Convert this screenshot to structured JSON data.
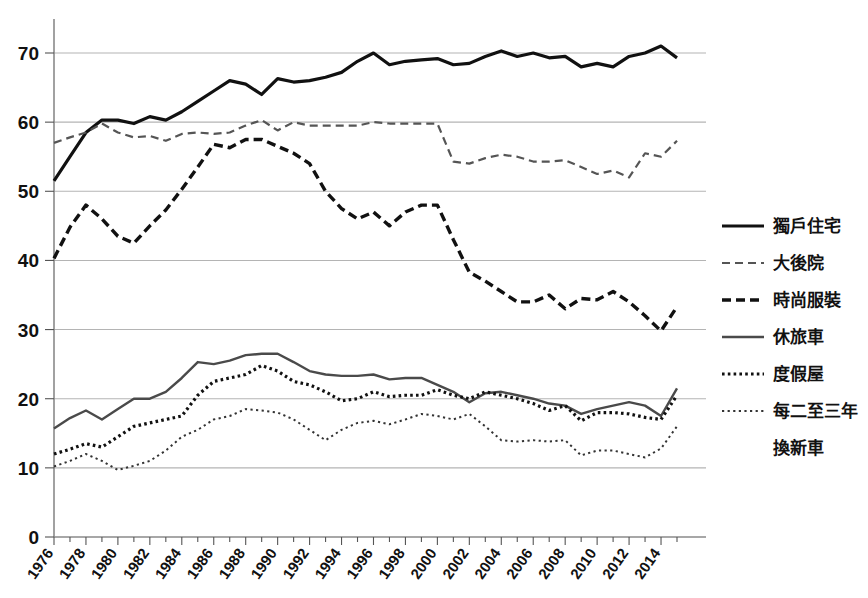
{
  "chart_data": {
    "type": "line",
    "title": "",
    "xlabel": "",
    "ylabel": "",
    "ylim": [
      0,
      75
    ],
    "yticks": [
      0,
      10,
      20,
      30,
      40,
      50,
      60,
      70
    ],
    "xlim": [
      1976,
      2015
    ],
    "xticks": [
      1976,
      1978,
      1980,
      1982,
      1984,
      1986,
      1988,
      1990,
      1992,
      1994,
      1996,
      1998,
      2000,
      2002,
      2004,
      2006,
      2008,
      2010,
      2012,
      2014
    ],
    "xtick_labels": [
      "1976",
      "1978",
      "1980",
      "1982",
      "1984",
      "1986",
      "1988",
      "1990",
      "1992",
      "1994",
      "1996",
      "1998",
      "2000",
      "2002",
      "2004",
      "2006",
      "2008",
      "2010",
      "2012",
      "2014"
    ],
    "grid": "horizontal",
    "legend_position": "right",
    "x": [
      1976,
      1977,
      1978,
      1979,
      1980,
      1981,
      1982,
      1983,
      1984,
      1985,
      1986,
      1987,
      1988,
      1989,
      1990,
      1991,
      1992,
      1993,
      1994,
      1995,
      1996,
      1997,
      1998,
      1999,
      2000,
      2001,
      2002,
      2003,
      2004,
      2005,
      2006,
      2007,
      2008,
      2009,
      2010,
      2011,
      2012,
      2013,
      2014,
      2015
    ],
    "series": [
      {
        "name": "獨戶住宅",
        "style": "solid-thick",
        "color": "#111111",
        "values": [
          51.5,
          55.0,
          58.5,
          60.3,
          60.3,
          59.8,
          60.8,
          60.3,
          61.5,
          63.0,
          64.5,
          66.0,
          65.5,
          64.0,
          66.3,
          65.8,
          66.0,
          66.5,
          67.2,
          68.8,
          70.0,
          68.3,
          68.8,
          69.0,
          69.2,
          68.3,
          68.5,
          69.5,
          70.3,
          69.5,
          70.0,
          69.3,
          69.5,
          68.0,
          68.5,
          68.0,
          69.5,
          70.0,
          71.0,
          69.3
        ]
      },
      {
        "name": "大後院",
        "style": "dashed-medium",
        "color": "#555555",
        "values": [
          57.0,
          57.8,
          58.5,
          59.8,
          58.5,
          57.8,
          58.0,
          57.3,
          58.3,
          58.5,
          58.3,
          58.5,
          59.5,
          60.3,
          58.8,
          60.0,
          59.5,
          59.5,
          59.5,
          59.5,
          60.0,
          59.8,
          59.8,
          59.8,
          59.8,
          54.3,
          54.0,
          54.8,
          55.3,
          55.0,
          54.3,
          54.3,
          54.5,
          53.5,
          52.5,
          53.0,
          52.0,
          55.5,
          55.0,
          57.3
        ]
      },
      {
        "name": "時尚服裝",
        "style": "dashed-thick",
        "color": "#111111",
        "values": [
          40.3,
          44.8,
          48.0,
          46.0,
          43.5,
          42.5,
          45.0,
          47.3,
          50.3,
          53.5,
          56.8,
          56.3,
          57.5,
          57.5,
          56.5,
          55.5,
          54.0,
          50.0,
          47.5,
          46.0,
          47.0,
          45.0,
          47.0,
          48.0,
          48.0,
          43.0,
          38.3,
          37.0,
          35.5,
          34.0,
          34.0,
          35.0,
          33.0,
          34.5,
          34.3,
          35.5,
          34.0,
          32.0,
          29.8,
          33.3
        ]
      },
      {
        "name": "休旅車",
        "style": "solid-medium",
        "color": "#4a4a4a",
        "values": [
          15.7,
          17.2,
          18.3,
          17.0,
          18.5,
          20.0,
          20.0,
          21.0,
          23.0,
          25.3,
          25.0,
          25.5,
          26.3,
          26.5,
          26.5,
          25.3,
          24.0,
          23.5,
          23.3,
          23.3,
          23.5,
          22.8,
          23.0,
          23.0,
          22.0,
          21.0,
          19.5,
          20.8,
          21.0,
          20.5,
          20.0,
          19.3,
          19.0,
          17.8,
          18.5,
          19.0,
          19.5,
          19.0,
          17.5,
          21.5
        ]
      },
      {
        "name": "度假屋",
        "style": "dotted-thick",
        "color": "#111111",
        "values": [
          12.0,
          12.7,
          13.5,
          13.0,
          14.5,
          16.0,
          16.5,
          17.0,
          17.5,
          20.5,
          22.5,
          23.0,
          23.5,
          24.8,
          24.0,
          22.5,
          22.0,
          21.0,
          19.7,
          20.0,
          21.0,
          20.3,
          20.5,
          20.5,
          21.3,
          20.5,
          20.0,
          21.0,
          20.5,
          20.0,
          19.3,
          18.3,
          19.0,
          16.8,
          18.0,
          18.0,
          17.8,
          17.3,
          17.0,
          20.5
        ]
      },
      {
        "name": "每二至三年換新車",
        "style": "dotted-fine",
        "color": "#333333",
        "values": [
          10.2,
          11.0,
          12.0,
          11.0,
          9.7,
          10.3,
          11.0,
          12.5,
          14.5,
          15.5,
          17.0,
          17.5,
          18.5,
          18.3,
          18.0,
          17.0,
          15.5,
          14.0,
          15.5,
          16.5,
          16.8,
          16.3,
          17.0,
          17.8,
          17.5,
          17.0,
          17.8,
          16.0,
          14.0,
          13.8,
          14.0,
          13.8,
          14.0,
          11.8,
          12.5,
          12.5,
          12.0,
          11.5,
          12.8,
          16.0
        ]
      }
    ]
  },
  "legend": {
    "items": [
      {
        "label": "獨戶住宅"
      },
      {
        "label": "大後院"
      },
      {
        "label": "時尚服裝"
      },
      {
        "label": "休旅車"
      },
      {
        "label": "度假屋"
      },
      {
        "label": "每二至三年"
      },
      {
        "label": "換新車"
      }
    ]
  }
}
